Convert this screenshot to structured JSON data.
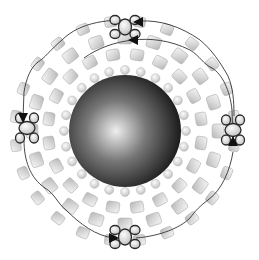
{
  "diagram": {
    "type": "beadwork-pattern",
    "center": {
      "x": 125,
      "y": 131
    },
    "colors": {
      "background": "#ffffff",
      "sphere_dark": "#1e1e1e",
      "sphere_highlight": "#e8e8e8",
      "bead_fill_light": "#f2f2f2",
      "bead_fill_dark": "#bdbdbd",
      "bead_outline": "#a8a8a8",
      "highlight_outline": "#2a2a2a",
      "thread": "#333333"
    },
    "central_sphere": {
      "label": "large-focal-bead",
      "radius": 56
    },
    "rings": [
      {
        "name": "inner-round-beads",
        "radius": 61,
        "count": 24,
        "shape": "round",
        "size": 9
      },
      {
        "name": "cube-ring-1",
        "radius": 77,
        "count": 20,
        "shape": "cube",
        "size": 13
      },
      {
        "name": "cube-ring-2",
        "radius": 93,
        "count": 20,
        "shape": "cube",
        "size": 14
      },
      {
        "name": "cube-ring-3",
        "radius": 110,
        "count": 24,
        "shape": "cube",
        "size": 12
      }
    ],
    "highlighted_clusters": [
      {
        "position": "top",
        "x": 125,
        "y": 27
      },
      {
        "position": "left",
        "x": 27,
        "y": 128
      },
      {
        "position": "right",
        "x": 233,
        "y": 130
      },
      {
        "position": "bottom",
        "x": 125,
        "y": 237
      }
    ],
    "arrows": [
      {
        "direction": "left",
        "x": 138,
        "y": 22
      },
      {
        "direction": "left",
        "x": 133,
        "y": 40
      },
      {
        "direction": "down",
        "x": 23,
        "y": 118
      },
      {
        "direction": "up",
        "x": 233,
        "y": 141
      },
      {
        "direction": "right",
        "x": 114,
        "y": 238
      }
    ]
  }
}
